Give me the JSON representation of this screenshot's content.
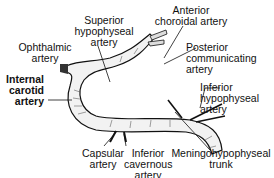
{
  "diagram": {
    "labels": {
      "superior_hypophyseal": [
        "Superior",
        "hypophyseal",
        "artery"
      ],
      "anterior_choroidal": [
        "Anterior",
        "choroidal artery"
      ],
      "ophthalmic": [
        "Ophthalmic",
        "artery"
      ],
      "posterior_communicating": [
        "Posterior",
        "communicating",
        "artery"
      ],
      "internal_carotid": [
        "Internal",
        "carotid",
        "artery"
      ],
      "inferior_hypophyseal": [
        "Inferior",
        "hypophyseal",
        "artery"
      ],
      "capsular": [
        "Capsular",
        "artery"
      ],
      "inferior_cavernous": [
        "Inferior",
        "cavernous",
        "artery"
      ],
      "meningohypophyseal": [
        "Meningohypophyseal",
        "trunk"
      ]
    },
    "colors": {
      "ink": "#111111",
      "vessel_fill": "#f2f2f2",
      "background": "#ffffff"
    }
  }
}
